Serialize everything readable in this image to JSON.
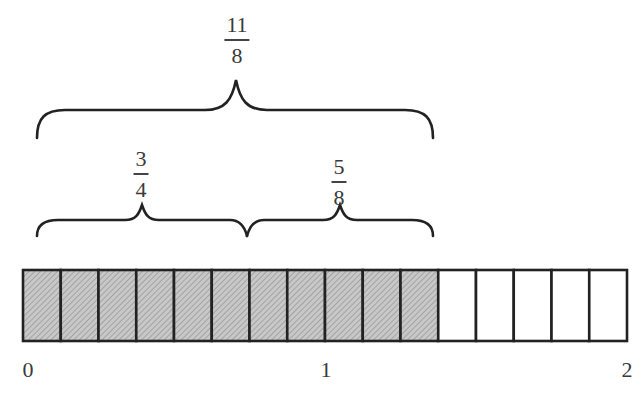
{
  "diagram": {
    "total_fraction": {
      "numerator": "11",
      "denominator": "8"
    },
    "part_fractions": [
      {
        "numerator": "3",
        "denominator": "4"
      },
      {
        "numerator": "5",
        "denominator": "8"
      }
    ],
    "number_line": {
      "labels": [
        "0",
        "1",
        "2"
      ],
      "segments_total": 16,
      "segments_shaded": 11,
      "segments_per_unit": 8
    },
    "colors": {
      "shaded_fill": "#c8c8c8",
      "hatch": "#8a8a8a",
      "stroke": "#222222",
      "unshaded_fill": "#ffffff"
    }
  }
}
